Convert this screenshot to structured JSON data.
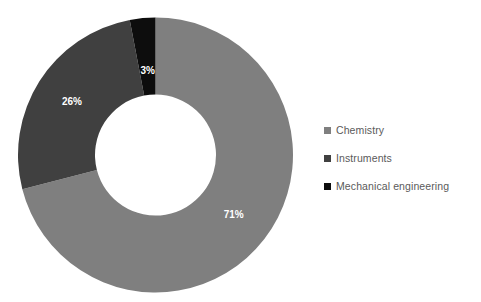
{
  "chart_data": {
    "type": "pie",
    "variant": "donut",
    "title": "",
    "subtitle": "",
    "xlabel": "",
    "ylabel": "",
    "grid": false,
    "legend_position": "right",
    "hole_ratio": 0.44,
    "start_angle_deg": 0,
    "direction": "clockwise",
    "categories": [
      "Chemistry",
      "Instruments",
      "Mechanical engineering"
    ],
    "values": [
      71,
      26,
      3
    ],
    "unit": "%",
    "data_labels": [
      "71%",
      "26%",
      "3%"
    ],
    "colors": [
      "#7f7f7f",
      "#404040",
      "#0d0d0d"
    ],
    "slices": [
      {
        "name": "Chemistry",
        "value": 71,
        "label": "71%",
        "color": "#7f7f7f",
        "label_color": "#ffffff",
        "start_pct": 0,
        "end_pct": 71
      },
      {
        "name": "Instruments",
        "value": 26,
        "label": "26%",
        "color": "#404040",
        "label_color": "#ffffff",
        "start_pct": 71,
        "end_pct": 97
      },
      {
        "name": "Mechanical engineering",
        "value": 3,
        "label": "3%",
        "color": "#0d0d0d",
        "label_color": "#ffffff",
        "start_pct": 97,
        "end_pct": 100
      }
    ]
  },
  "legend": {
    "items": [
      {
        "label": "Chemistry",
        "color": "#7f7f7f"
      },
      {
        "label": "Instruments",
        "color": "#404040"
      },
      {
        "label": "Mechanical engineering",
        "color": "#0d0d0d"
      }
    ]
  },
  "canvas": {
    "background": "#ffffff",
    "text_color": "#5a5a5a"
  }
}
